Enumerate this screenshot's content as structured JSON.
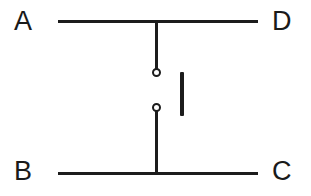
{
  "diagram": {
    "background_color": "#ffffff",
    "line_color": "#1c1c1c",
    "label_color": "#1a1a1a",
    "labels": {
      "top_left": "A",
      "top_right": "D",
      "bottom_left": "B",
      "bottom_right": "C"
    },
    "elements": {
      "top_rail": "horizontal conductor A to D",
      "bottom_rail": "horizontal conductor B to C",
      "top_stub": "vertical lead from top rail to upper terminal",
      "bottom_stub": "vertical lead from lower terminal to bottom rail",
      "upper_terminal": "open circle contact",
      "lower_terminal": "open circle contact",
      "switch_blade": "vertical bar beside contacts"
    }
  }
}
